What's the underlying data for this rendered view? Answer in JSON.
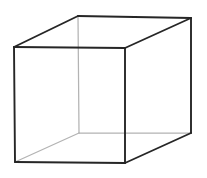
{
  "figure": {
    "type": "line-drawing",
    "background_color": "#ffffff",
    "canvas": {
      "width": 207,
      "height": 178
    },
    "stroke_colors": {
      "visible_edge": "#262626",
      "hidden_edge": "#b3b3b3"
    },
    "stroke_widths": {
      "visible_edge": 1.9,
      "hidden_edge": 1.25
    },
    "vertices": {
      "front_top_left": {
        "x": 14,
        "y": 47
      },
      "front_top_right": {
        "x": 125,
        "y": 48
      },
      "front_bottom_right": {
        "x": 125,
        "y": 163
      },
      "front_bottom_left": {
        "x": 15,
        "y": 162
      },
      "back_top_left": {
        "x": 78,
        "y": 16
      },
      "back_top_right": {
        "x": 191,
        "y": 18
      },
      "back_bottom_right": {
        "x": 191,
        "y": 133
      },
      "back_bottom_left": {
        "x": 79,
        "y": 133
      }
    },
    "edges": [
      {
        "name": "front-top",
        "from": "front_top_left",
        "to": "front_top_right",
        "visibility": "visible"
      },
      {
        "name": "front-right",
        "from": "front_top_right",
        "to": "front_bottom_right",
        "visibility": "visible"
      },
      {
        "name": "front-bottom",
        "from": "front_bottom_right",
        "to": "front_bottom_left",
        "visibility": "visible"
      },
      {
        "name": "front-left",
        "from": "front_bottom_left",
        "to": "front_top_left",
        "visibility": "visible"
      },
      {
        "name": "back-top",
        "from": "back_top_left",
        "to": "back_top_right",
        "visibility": "visible"
      },
      {
        "name": "back-right",
        "from": "back_top_right",
        "to": "back_bottom_right",
        "visibility": "visible"
      },
      {
        "name": "back-bottom",
        "from": "back_bottom_right",
        "to": "back_bottom_left",
        "visibility": "hidden"
      },
      {
        "name": "back-left",
        "from": "back_bottom_left",
        "to": "back_top_left",
        "visibility": "hidden"
      },
      {
        "name": "connect-top-left",
        "from": "front_top_left",
        "to": "back_top_left",
        "visibility": "visible"
      },
      {
        "name": "connect-top-right",
        "from": "front_top_right",
        "to": "back_top_right",
        "visibility": "visible"
      },
      {
        "name": "connect-bottom-right",
        "from": "front_bottom_right",
        "to": "back_bottom_right",
        "visibility": "visible"
      },
      {
        "name": "connect-bottom-left",
        "from": "front_bottom_left",
        "to": "back_bottom_left",
        "visibility": "hidden"
      }
    ]
  }
}
